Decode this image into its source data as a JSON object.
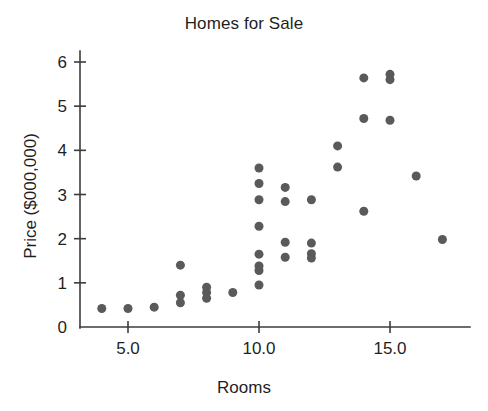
{
  "chart_data": {
    "type": "scatter",
    "title": "Homes for Sale",
    "xlabel": "Rooms",
    "ylabel": "Price ($000,000)",
    "xlim": [
      3.2,
      17.8
    ],
    "ylim": [
      0,
      6.2
    ],
    "xticks": [
      5.0,
      10.0,
      15.0
    ],
    "xticklabels": [
      "5.0",
      "10.0",
      "15.0"
    ],
    "yticks": [
      0,
      1,
      2,
      3,
      4,
      5,
      6
    ],
    "yticklabels": [
      "0",
      "1",
      "2",
      "3",
      "4",
      "5",
      "6"
    ],
    "grid": false,
    "legend": null,
    "marker": "circle",
    "marker_color": "#5a5a5a",
    "marker_size": 9,
    "points": [
      {
        "x": 4.0,
        "y": 0.42
      },
      {
        "x": 5.0,
        "y": 0.42
      },
      {
        "x": 6.0,
        "y": 0.45
      },
      {
        "x": 7.0,
        "y": 1.4
      },
      {
        "x": 7.0,
        "y": 0.72
      },
      {
        "x": 7.0,
        "y": 0.55
      },
      {
        "x": 8.0,
        "y": 0.9
      },
      {
        "x": 8.0,
        "y": 0.78
      },
      {
        "x": 8.0,
        "y": 0.65
      },
      {
        "x": 9.0,
        "y": 0.78
      },
      {
        "x": 10.0,
        "y": 3.6
      },
      {
        "x": 10.0,
        "y": 3.25
      },
      {
        "x": 10.0,
        "y": 2.88
      },
      {
        "x": 10.0,
        "y": 2.28
      },
      {
        "x": 10.0,
        "y": 1.65
      },
      {
        "x": 10.0,
        "y": 1.38
      },
      {
        "x": 10.0,
        "y": 1.28
      },
      {
        "x": 10.0,
        "y": 0.95
      },
      {
        "x": 11.0,
        "y": 3.16
      },
      {
        "x": 11.0,
        "y": 2.84
      },
      {
        "x": 11.0,
        "y": 1.92
      },
      {
        "x": 11.0,
        "y": 1.58
      },
      {
        "x": 12.0,
        "y": 2.88
      },
      {
        "x": 12.0,
        "y": 1.9
      },
      {
        "x": 12.0,
        "y": 1.66
      },
      {
        "x": 12.0,
        "y": 1.56
      },
      {
        "x": 13.0,
        "y": 4.1
      },
      {
        "x": 13.0,
        "y": 3.62
      },
      {
        "x": 14.0,
        "y": 5.64
      },
      {
        "x": 14.0,
        "y": 4.72
      },
      {
        "x": 14.0,
        "y": 2.62
      },
      {
        "x": 15.0,
        "y": 5.72
      },
      {
        "x": 15.0,
        "y": 5.6
      },
      {
        "x": 15.0,
        "y": 4.68
      },
      {
        "x": 16.0,
        "y": 3.42
      },
      {
        "x": 17.0,
        "y": 1.98
      }
    ]
  }
}
